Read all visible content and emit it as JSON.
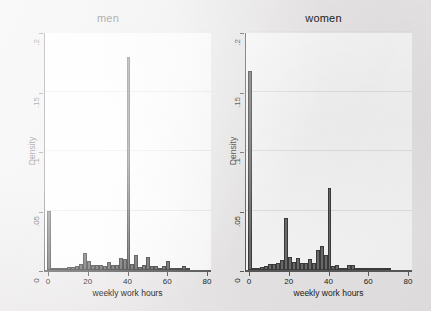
{
  "figure": {
    "background_color": "#eceaea",
    "plot_background_color": "#fdfdfd",
    "bar_fill_color": "#6e6e6e",
    "bar_edge_color": "#3d3d3d",
    "axis_color": "#5b5b5b",
    "grid_color": "#e6e6e6"
  },
  "chart_data": [
    {
      "type": "bar",
      "title": "men",
      "xlabel": "weekly work hours",
      "ylabel": "Density",
      "xlim": [
        -2,
        82
      ],
      "ylim": [
        0,
        0.2
      ],
      "xticks": [
        0,
        20,
        40,
        60,
        80
      ],
      "xtick_labels": [
        "0",
        "20",
        "40",
        "60",
        "80"
      ],
      "yticks": [
        0,
        0.05,
        0.1,
        0.15,
        0.2
      ],
      "ytick_labels": [
        "0",
        ".05",
        ".1",
        ".15",
        ".2"
      ],
      "grid": true,
      "bin_width": 2,
      "x": [
        0,
        2,
        4,
        6,
        8,
        10,
        12,
        14,
        16,
        18,
        20,
        22,
        24,
        26,
        28,
        30,
        32,
        34,
        36,
        38,
        40,
        42,
        44,
        46,
        48,
        50,
        52,
        54,
        56,
        58,
        60,
        62,
        64,
        66,
        68,
        70
      ],
      "values": [
        0.0495,
        0.0006,
        0.0008,
        0.0012,
        0.0016,
        0.0022,
        0.0028,
        0.0034,
        0.0052,
        0.0145,
        0.0072,
        0.004,
        0.0046,
        0.0044,
        0.003,
        0.0064,
        0.0038,
        0.004,
        0.0102,
        0.0093,
        0.179,
        0.0052,
        0.0122,
        0.0022,
        0.0038,
        0.0112,
        0.0032,
        0.003,
        0.0018,
        0.003,
        0.0076,
        0.001,
        0.0012,
        0.0005,
        0.0034,
        0.0006
      ]
    },
    {
      "type": "bar",
      "title": "women",
      "xlabel": "weekly work hours",
      "ylabel": "Density",
      "xlim": [
        -2,
        82
      ],
      "ylim": [
        0,
        0.2
      ],
      "xticks": [
        0,
        20,
        40,
        60,
        80
      ],
      "xtick_labels": [
        "0",
        "20",
        "40",
        "60",
        "80"
      ],
      "yticks": [
        0,
        0.05,
        0.1,
        0.15,
        0.2
      ],
      "ytick_labels": [
        "0",
        ".05",
        ".1",
        ".15",
        ".2"
      ],
      "grid": true,
      "bin_width": 2,
      "x": [
        0,
        2,
        4,
        6,
        8,
        10,
        12,
        14,
        16,
        18,
        20,
        22,
        24,
        26,
        28,
        30,
        32,
        34,
        36,
        38,
        40,
        42,
        44,
        46,
        48,
        50,
        52,
        54,
        56,
        58,
        60,
        62,
        64,
        66,
        68,
        70
      ],
      "values": [
        0.1672,
        0.0005,
        0.0012,
        0.0022,
        0.0034,
        0.0048,
        0.005,
        0.0062,
        0.0088,
        0.044,
        0.0108,
        0.0068,
        0.0098,
        0.0062,
        0.006,
        0.0094,
        0.006,
        0.0168,
        0.0205,
        0.0128,
        0.069,
        0.0036,
        0.0042,
        0.0006,
        0.0008,
        0.0044,
        0.0038,
        0.0004,
        0.0003,
        0.0002,
        0.0004,
        0.0002,
        0.0005,
        0.0002,
        0.0005,
        0.0002
      ]
    }
  ]
}
